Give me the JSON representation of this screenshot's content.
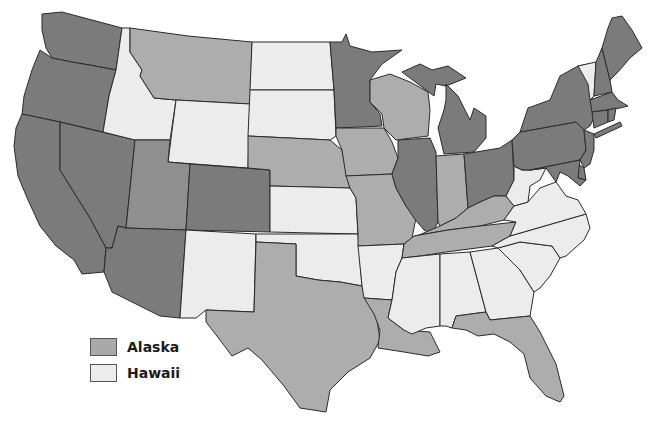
{
  "map": {
    "title": "",
    "colors": {
      "dark": "#7b7b7b",
      "mid_dark": "#8f8f8f",
      "mid": "#adadad",
      "light": "#ececec",
      "water": "#ffffff",
      "border": "#2b2b2b"
    },
    "states": [
      {
        "id": "WA",
        "shade": "dark"
      },
      {
        "id": "OR",
        "shade": "dark"
      },
      {
        "id": "CA",
        "shade": "dark"
      },
      {
        "id": "NV",
        "shade": "dark"
      },
      {
        "id": "ID",
        "shade": "light"
      },
      {
        "id": "MT",
        "shade": "mid"
      },
      {
        "id": "WY",
        "shade": "light"
      },
      {
        "id": "UT",
        "shade": "mid_dark"
      },
      {
        "id": "AZ",
        "shade": "dark"
      },
      {
        "id": "CO",
        "shade": "dark"
      },
      {
        "id": "NM",
        "shade": "light"
      },
      {
        "id": "ND",
        "shade": "light"
      },
      {
        "id": "SD",
        "shade": "light"
      },
      {
        "id": "NE",
        "shade": "mid"
      },
      {
        "id": "KS",
        "shade": "light"
      },
      {
        "id": "OK",
        "shade": "light"
      },
      {
        "id": "TX",
        "shade": "mid"
      },
      {
        "id": "MN",
        "shade": "dark"
      },
      {
        "id": "IA",
        "shade": "mid"
      },
      {
        "id": "MO",
        "shade": "mid"
      },
      {
        "id": "AR",
        "shade": "light"
      },
      {
        "id": "LA",
        "shade": "mid"
      },
      {
        "id": "WI",
        "shade": "mid"
      },
      {
        "id": "IL",
        "shade": "dark"
      },
      {
        "id": "MI",
        "shade": "dark"
      },
      {
        "id": "IN",
        "shade": "mid"
      },
      {
        "id": "OH",
        "shade": "dark"
      },
      {
        "id": "KY",
        "shade": "mid"
      },
      {
        "id": "TN",
        "shade": "mid"
      },
      {
        "id": "MS",
        "shade": "light"
      },
      {
        "id": "AL",
        "shade": "light"
      },
      {
        "id": "GA",
        "shade": "light"
      },
      {
        "id": "FL",
        "shade": "mid"
      },
      {
        "id": "SC",
        "shade": "light"
      },
      {
        "id": "NC",
        "shade": "light"
      },
      {
        "id": "VA",
        "shade": "light"
      },
      {
        "id": "WV",
        "shade": "light"
      },
      {
        "id": "PA",
        "shade": "dark"
      },
      {
        "id": "NY",
        "shade": "dark"
      },
      {
        "id": "VT",
        "shade": "light"
      },
      {
        "id": "NH",
        "shade": "dark"
      },
      {
        "id": "ME",
        "shade": "dark"
      },
      {
        "id": "MA",
        "shade": "dark"
      },
      {
        "id": "CT",
        "shade": "dark"
      },
      {
        "id": "RI",
        "shade": "dark"
      },
      {
        "id": "NJ",
        "shade": "dark"
      },
      {
        "id": "DE",
        "shade": "dark"
      },
      {
        "id": "MD",
        "shade": "dark"
      }
    ]
  },
  "legend": {
    "items": [
      {
        "label": "Alaska",
        "color": "#a9a9a9"
      },
      {
        "label": "Hawaii",
        "color": "#ececec"
      }
    ]
  }
}
